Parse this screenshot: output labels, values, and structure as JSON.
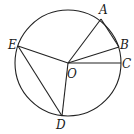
{
  "diagram": {
    "type": "circle-geometry",
    "circle": {
      "center": "O",
      "cx": 68,
      "cy": 63,
      "r": 53
    },
    "points": [
      {
        "name": "A",
        "x": 101,
        "y": 19,
        "label_x": 99,
        "label_y": 14
      },
      {
        "name": "B",
        "x": 119,
        "y": 47,
        "label_x": 120,
        "label_y": 48
      },
      {
        "name": "C",
        "x": 121,
        "y": 63,
        "label_x": 123,
        "label_y": 67
      },
      {
        "name": "D",
        "x": 62,
        "y": 116,
        "label_x": 55,
        "label_y": 128
      },
      {
        "name": "E",
        "x": 18,
        "y": 46,
        "label_x": 8,
        "label_y": 48
      },
      {
        "name": "O",
        "x": 68,
        "y": 63,
        "label_x": 68,
        "label_y": 78
      }
    ],
    "segments": [
      [
        "O",
        "A"
      ],
      [
        "O",
        "B"
      ],
      [
        "O",
        "C"
      ],
      [
        "O",
        "D"
      ],
      [
        "O",
        "E"
      ],
      [
        "E",
        "D"
      ],
      [
        "A",
        "B"
      ]
    ],
    "labels": {
      "A": "A",
      "B": "B",
      "C": "C",
      "D": "D",
      "E": "E",
      "O": "O"
    }
  }
}
